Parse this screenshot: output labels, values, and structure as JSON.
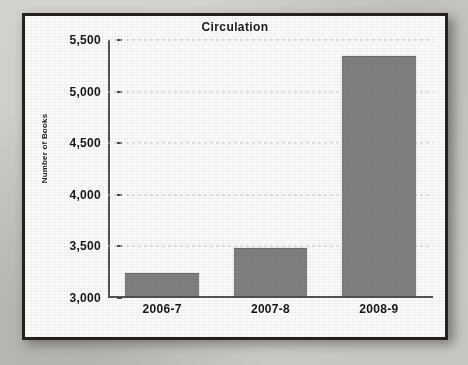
{
  "chart_data": {
    "type": "bar",
    "title": "Circulation",
    "xlabel": "",
    "ylabel": "Number of Books",
    "categories": [
      "2006-7",
      "2007-8",
      "2008-9"
    ],
    "values": [
      3215,
      3460,
      5315
    ],
    "ylim": [
      3000,
      5500
    ],
    "yticks": [
      3000,
      3500,
      4000,
      4500,
      5000,
      5500
    ],
    "ytick_labels": [
      "3,000",
      "3,500",
      "4,000",
      "4,500",
      "5,000",
      "5,500"
    ],
    "grid": true,
    "legend": false,
    "series": [
      {
        "name": "Number of Books",
        "color": "#808080",
        "values": [
          3215,
          3460,
          5315
        ]
      }
    ]
  },
  "figure": {
    "frame_color": "#24211f",
    "background_color": "#fbfbfa",
    "page_color": "#cfcfcb",
    "axis_color": "#56524f",
    "gridline_color": "#c9c9c5",
    "bar_color": "#808080"
  }
}
